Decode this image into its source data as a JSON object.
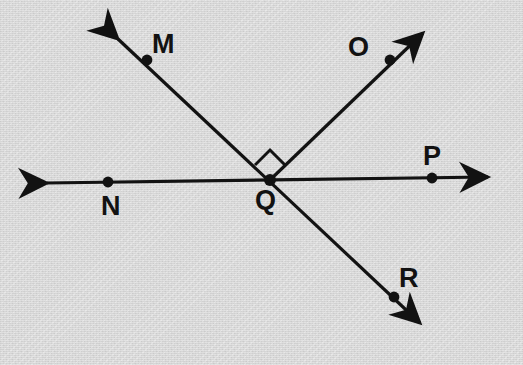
{
  "diagram": {
    "kind": "geometry-figure",
    "canvas": {
      "width": 523,
      "height": 365
    },
    "colors": {
      "background": "#d6d6d6",
      "ink": "#121212"
    },
    "style": {
      "stroke_width": 3.2,
      "dot_radius": 5.2,
      "label_font_size": 27
    },
    "intersection": {
      "name": "Q",
      "x": 270,
      "y": 180
    },
    "lines": [
      {
        "name": "line-MR",
        "label": "MR",
        "double_arrow": true,
        "from_arrow_tip": {
          "x": 104,
          "y": 26
        },
        "to_arrow_tip": {
          "x": 432,
          "y": 334
        }
      },
      {
        "name": "line-NP",
        "label": "NP",
        "double_arrow": true,
        "from_arrow_tip": {
          "x": 34,
          "y": 183
        },
        "to_arrow_tip": {
          "x": 500,
          "y": 177
        }
      }
    ],
    "rays": [
      {
        "name": "ray-QO",
        "label": "QO",
        "origin": {
          "x": 270,
          "y": 180
        },
        "arrow_tip": {
          "x": 433,
          "y": 23
        }
      }
    ],
    "right_angle": {
      "name": "right-angle-MQO",
      "between": "ray QM and ray QO",
      "vertex": {
        "x": 270,
        "y": 180
      },
      "apex": {
        "x": 268,
        "y": 150
      },
      "size": 21,
      "marker": "square"
    },
    "points": [
      {
        "id": "m",
        "label": "M",
        "dot": {
          "x": 147,
          "y": 60
        },
        "label_pos": {
          "x": 152,
          "y": 31
        }
      },
      {
        "id": "o",
        "label": "O",
        "dot": {
          "x": 390,
          "y": 60
        },
        "label_pos": {
          "x": 348,
          "y": 34
        }
      },
      {
        "id": "n",
        "label": "N",
        "dot": {
          "x": 108,
          "y": 182
        },
        "label_pos": {
          "x": 101,
          "y": 193
        }
      },
      {
        "id": "q",
        "label": "Q",
        "dot": {
          "x": 270,
          "y": 180
        },
        "label_pos": {
          "x": 255,
          "y": 187
        }
      },
      {
        "id": "p",
        "label": "P",
        "dot": {
          "x": 432,
          "y": 178
        },
        "label_pos": {
          "x": 423,
          "y": 143
        }
      },
      {
        "id": "r",
        "label": "R",
        "dot": {
          "x": 394,
          "y": 297
        },
        "label_pos": {
          "x": 399,
          "y": 265
        }
      }
    ]
  }
}
